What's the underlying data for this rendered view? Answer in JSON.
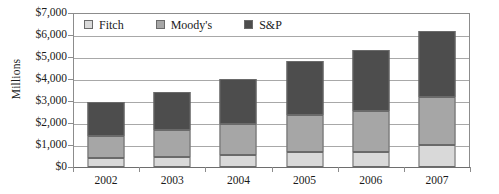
{
  "chart_data": {
    "type": "bar",
    "stacked": true,
    "title": "",
    "xlabel": "",
    "ylabel": "Millions",
    "categories": [
      "2002",
      "2003",
      "2004",
      "2005",
      "2006",
      "2007"
    ],
    "series": [
      {
        "name": "Fitch",
        "color": "#d9d9d9",
        "values": [
          400,
          450,
          550,
          700,
          700,
          1000
        ]
      },
      {
        "name": "Moody's",
        "color": "#a6a6a6",
        "values": [
          1000,
          1250,
          1400,
          1650,
          1850,
          2200
        ]
      },
      {
        "name": "S&P",
        "color": "#4d4d4d",
        "values": [
          1550,
          1720,
          2050,
          2450,
          2750,
          3000
        ]
      }
    ],
    "totals": [
      2950,
      3420,
      4000,
      4800,
      5300,
      6200
    ],
    "ylim": [
      0,
      7000
    ],
    "ytick_values": [
      0,
      1000,
      2000,
      3000,
      4000,
      5000,
      6000,
      7000
    ],
    "ytick_labels": [
      "$0",
      "$1,000",
      "$2,000",
      "$3,000",
      "$4,000",
      "$5,000",
      "$6,000",
      "$7,000"
    ],
    "grid": true,
    "grid_axis": "y",
    "legend_position": "top-left-inside",
    "legend_entries": [
      "Fitch",
      "Moody's",
      "S&P"
    ]
  }
}
